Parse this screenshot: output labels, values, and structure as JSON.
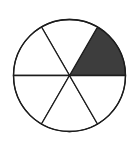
{
  "diagram": {
    "type": "fraction-circle",
    "total_sectors": 6,
    "shaded_sector_count": 1,
    "fraction_shaded": "1/6",
    "colors": {
      "background": "#ffffff",
      "shaded_fill": "#3d3d3d",
      "unshaded_fill": "#ffffff",
      "stroke": "#1c1c1c"
    },
    "geometry": {
      "center_x": 69.5,
      "center_y": 75.5,
      "radius": 56,
      "stroke_width": 1.3,
      "sector_angle_deg": 60
    },
    "sectors": [
      {
        "start_deg": 0,
        "end_deg": 60,
        "shaded": true
      },
      {
        "start_deg": 60,
        "end_deg": 120,
        "shaded": false
      },
      {
        "start_deg": 120,
        "end_deg": 180,
        "shaded": false
      },
      {
        "start_deg": 180,
        "end_deg": 240,
        "shaded": false
      },
      {
        "start_deg": 240,
        "end_deg": 300,
        "shaded": false
      },
      {
        "start_deg": 300,
        "end_deg": 360,
        "shaded": false
      }
    ]
  }
}
